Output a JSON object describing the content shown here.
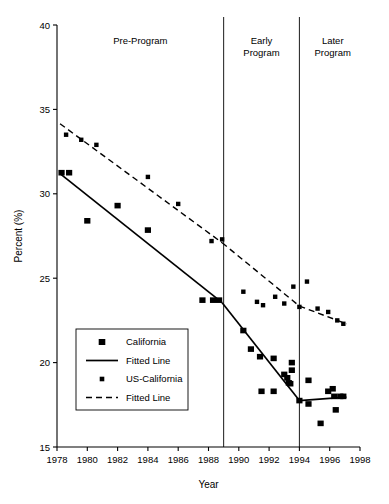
{
  "chart_data": {
    "type": "scatter",
    "title": "",
    "xlabel": "Year",
    "ylabel": "Percent (%)",
    "xlim": [
      1978,
      1998
    ],
    "ylim": [
      15,
      40
    ],
    "xticks": [
      1978,
      1980,
      1982,
      1984,
      1986,
      1988,
      1990,
      1992,
      1994,
      1996,
      1998
    ],
    "yticks": [
      15,
      20,
      25,
      30,
      35,
      40
    ],
    "grid": false,
    "legend_position": "left-middle",
    "annotations": [
      {
        "label": "Pre-Program",
        "x": 1983.5,
        "y": 39.0
      },
      {
        "label": "Early\nProgram",
        "x": 1991.5,
        "y": 39.0
      },
      {
        "label": "Later\nProgram",
        "x": 1996.2,
        "y": 39.0
      }
    ],
    "vertical_dividers": [
      1989.0,
      1994.0
    ],
    "series": [
      {
        "name": "California",
        "marker": "square-large",
        "points": [
          {
            "x": 1978.3,
            "y": 31.25
          },
          {
            "x": 1978.8,
            "y": 31.25
          },
          {
            "x": 1980.0,
            "y": 28.4
          },
          {
            "x": 1982.0,
            "y": 29.3
          },
          {
            "x": 1984.0,
            "y": 27.85
          },
          {
            "x": 1987.6,
            "y": 23.7
          },
          {
            "x": 1988.3,
            "y": 23.7
          },
          {
            "x": 1988.7,
            "y": 23.7
          },
          {
            "x": 1990.3,
            "y": 21.9
          },
          {
            "x": 1990.8,
            "y": 20.8
          },
          {
            "x": 1991.4,
            "y": 20.35
          },
          {
            "x": 1991.5,
            "y": 18.3
          },
          {
            "x": 1992.3,
            "y": 20.25
          },
          {
            "x": 1992.3,
            "y": 18.3
          },
          {
            "x": 1993.0,
            "y": 19.3
          },
          {
            "x": 1993.2,
            "y": 19.1
          },
          {
            "x": 1993.3,
            "y": 18.8
          },
          {
            "x": 1993.4,
            "y": 18.75
          },
          {
            "x": 1993.5,
            "y": 20.0
          },
          {
            "x": 1993.5,
            "y": 19.55
          },
          {
            "x": 1994.0,
            "y": 17.75
          },
          {
            "x": 1994.6,
            "y": 18.95
          },
          {
            "x": 1994.6,
            "y": 17.55
          },
          {
            "x": 1995.4,
            "y": 16.4
          },
          {
            "x": 1995.9,
            "y": 18.3
          },
          {
            "x": 1996.2,
            "y": 18.45
          },
          {
            "x": 1996.3,
            "y": 18.0
          },
          {
            "x": 1996.4,
            "y": 17.2
          },
          {
            "x": 1996.7,
            "y": 18.0
          },
          {
            "x": 1996.9,
            "y": 18.0
          }
        ]
      },
      {
        "name": "US-California",
        "marker": "square-small",
        "points": [
          {
            "x": 1978.6,
            "y": 33.5
          },
          {
            "x": 1979.6,
            "y": 33.2
          },
          {
            "x": 1980.6,
            "y": 32.9
          },
          {
            "x": 1984.0,
            "y": 31.0
          },
          {
            "x": 1986.0,
            "y": 29.4
          },
          {
            "x": 1988.2,
            "y": 27.2
          },
          {
            "x": 1988.9,
            "y": 27.3
          },
          {
            "x": 1990.3,
            "y": 24.2
          },
          {
            "x": 1991.2,
            "y": 23.6
          },
          {
            "x": 1991.6,
            "y": 23.4
          },
          {
            "x": 1992.4,
            "y": 23.9
          },
          {
            "x": 1993.0,
            "y": 23.5
          },
          {
            "x": 1993.6,
            "y": 24.5
          },
          {
            "x": 1994.0,
            "y": 23.3
          },
          {
            "x": 1994.5,
            "y": 24.8
          },
          {
            "x": 1995.2,
            "y": 23.2
          },
          {
            "x": 1995.9,
            "y": 23.0
          },
          {
            "x": 1996.5,
            "y": 22.5
          },
          {
            "x": 1996.9,
            "y": 22.3
          }
        ]
      }
    ],
    "fitted_lines": [
      {
        "name": "Fitted Line (California, solid)",
        "style": "solid",
        "segments": [
          [
            {
              "x": 1978.2,
              "y": 31.2
            },
            {
              "x": 1988.9,
              "y": 23.55
            }
          ],
          [
            {
              "x": 1988.9,
              "y": 23.55
            },
            {
              "x": 1994.0,
              "y": 17.75
            }
          ],
          [
            {
              "x": 1994.0,
              "y": 17.75
            },
            {
              "x": 1997.1,
              "y": 17.95
            }
          ]
        ]
      },
      {
        "name": "Fitted Line (US-California, dashed)",
        "style": "dashed",
        "segments": [
          [
            {
              "x": 1978.2,
              "y": 34.15
            },
            {
              "x": 1988.9,
              "y": 27.1
            }
          ],
          [
            {
              "x": 1988.9,
              "y": 27.1
            },
            {
              "x": 1994.0,
              "y": 23.35
            }
          ],
          [
            {
              "x": 1994.0,
              "y": 23.35
            },
            {
              "x": 1997.1,
              "y": 22.3
            }
          ]
        ]
      }
    ]
  },
  "legend": {
    "entries": [
      {
        "label": "California",
        "kind": "square-large"
      },
      {
        "label": "Fitted Line",
        "kind": "solid-line"
      },
      {
        "label": "US-California",
        "kind": "square-small"
      },
      {
        "label": "Fitted Line",
        "kind": "dashed-line"
      }
    ]
  },
  "axis": {
    "x_title": "Year",
    "y_title": "Percent (%)"
  }
}
